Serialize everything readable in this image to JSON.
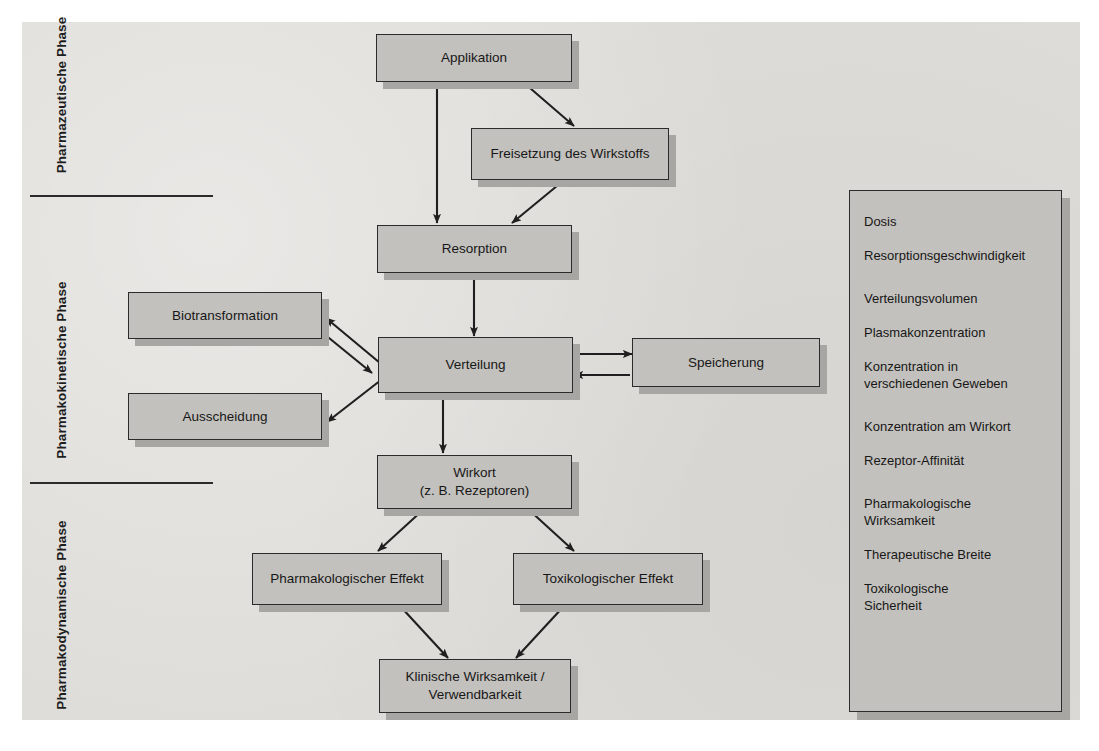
{
  "diagram": {
    "colors": {
      "page_background": "#dedcd8",
      "node_fill": "#c3c1bd",
      "node_border": "#2b2b2b",
      "shadow": "#a8a6a2",
      "text": "#171717"
    },
    "phases": [
      {
        "label": "Pharmazeutische\nPhase",
        "line1": "Pharmazeutische",
        "line2": "Phase"
      },
      {
        "label": "Pharmakokinetische\nPhase",
        "line1": "Pharmakokinetische",
        "line2": "Phase"
      },
      {
        "label": "Pharmakodynamische\nPhase",
        "line1": "Pharmakodynamische",
        "line2": "Phase"
      }
    ],
    "nodes": [
      {
        "id": "applikation",
        "label": "Applikation"
      },
      {
        "id": "freisetzung",
        "label": "Freisetzung des Wirkstoffs"
      },
      {
        "id": "resorption",
        "label": "Resorption"
      },
      {
        "id": "biotransformation",
        "label": "Biotransformation"
      },
      {
        "id": "verteilung",
        "label": "Verteilung"
      },
      {
        "id": "speicherung",
        "label": "Speicherung"
      },
      {
        "id": "ausscheidung",
        "label": "Ausscheidung"
      },
      {
        "id": "wirkort_line1",
        "label": "Wirkort"
      },
      {
        "id": "wirkort_line2",
        "label": "(z. B. Rezeptoren)"
      },
      {
        "id": "pharmakologischer_effekt",
        "label": "Pharmakologischer Effekt"
      },
      {
        "id": "toxikologischer_effekt",
        "label": "Toxikologischer Effekt"
      },
      {
        "id": "klinische_line1",
        "label": "Klinische Wirksamkeit /"
      },
      {
        "id": "klinische_line2",
        "label": "Verwendbarkeit"
      }
    ],
    "parameters": {
      "group1": [
        "Dosis",
        "Resorptionsgeschwindigkeit"
      ],
      "group2": [
        "Verteilungsvolumen",
        "Plasmakonzentration",
        "Konzentration in\nverschiedenen Geweben"
      ],
      "group3": [
        "Konzentration am Wirkort",
        "Rezeptor-Affinität"
      ],
      "group4": [
        "Pharmakologische\nWirksamkeit",
        "Therapeutische Breite",
        "Toxikologische\nSicherheit"
      ]
    },
    "edges": [
      {
        "from": "applikation",
        "to": "resorption",
        "type": "single"
      },
      {
        "from": "applikation",
        "to": "freisetzung",
        "type": "single"
      },
      {
        "from": "freisetzung",
        "to": "resorption",
        "type": "single"
      },
      {
        "from": "resorption",
        "to": "verteilung",
        "type": "single"
      },
      {
        "from": "verteilung",
        "to": "biotransformation",
        "type": "bidirectional"
      },
      {
        "from": "verteilung",
        "to": "speicherung",
        "type": "bidirectional"
      },
      {
        "from": "verteilung",
        "to": "ausscheidung",
        "type": "single"
      },
      {
        "from": "verteilung",
        "to": "wirkort",
        "type": "single"
      },
      {
        "from": "wirkort",
        "to": "pharmakologischer_effekt",
        "type": "single"
      },
      {
        "from": "wirkort",
        "to": "toxikologischer_effekt",
        "type": "single"
      },
      {
        "from": "pharmakologischer_effekt",
        "to": "klinische",
        "type": "single"
      },
      {
        "from": "toxikologischer_effekt",
        "to": "klinische",
        "type": "single"
      }
    ]
  }
}
